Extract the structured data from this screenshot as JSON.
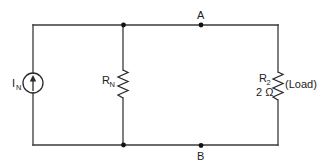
{
  "diagram": {
    "type": "circuit-schematic",
    "components": {
      "current_source": {
        "symbol": "I",
        "subscript": "N"
      },
      "norton_resistor": {
        "symbol": "R",
        "subscript": "N"
      },
      "load_resistor": {
        "symbol": "R",
        "subscript": "2",
        "value": "2 Ω",
        "note": "(Load)"
      }
    },
    "nodes": {
      "a": {
        "label": "A"
      },
      "b": {
        "label": "B"
      }
    },
    "colors": {
      "wire": "#3a3a3a",
      "node": "#111111",
      "text": "#222222"
    }
  }
}
